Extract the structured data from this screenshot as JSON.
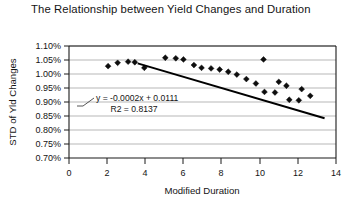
{
  "chart_data": {
    "type": "scatter",
    "title": "The Relationship between Yield Changes and Duration",
    "title_line1": "The Relationship between Yield Changes",
    "title_line2": "and Duration",
    "xlabel": "Modified Duration",
    "ylabel": "STD of Yld Changes",
    "xlim": [
      0,
      14
    ],
    "ylim": [
      0.007,
      0.011
    ],
    "xticks": [
      0,
      2,
      4,
      6,
      8,
      10,
      12,
      14
    ],
    "xtick_labels": [
      "0",
      "2",
      "4",
      "6",
      "8",
      "10",
      "12",
      "14"
    ],
    "yticks": [
      0.007,
      0.0075,
      0.008,
      0.0085,
      0.009,
      0.0095,
      0.01,
      0.0105,
      0.011
    ],
    "ytick_labels": [
      "0.70%",
      "0.75%",
      "0.80%",
      "0.85%",
      "0.90%",
      "0.95%",
      "1.00%",
      "1.05%",
      "1.10%"
    ],
    "grid": "horizontal",
    "legend": "none",
    "marker": "diamond",
    "series": [
      {
        "name": "STD of Yld Changes vs Modified Duration",
        "points": [
          {
            "x": 2.05,
            "y": 0.01028
          },
          {
            "x": 2.55,
            "y": 0.0104
          },
          {
            "x": 3.1,
            "y": 0.01044
          },
          {
            "x": 3.45,
            "y": 0.01042
          },
          {
            "x": 3.95,
            "y": 0.01022
          },
          {
            "x": 5.05,
            "y": 0.01058
          },
          {
            "x": 5.6,
            "y": 0.01056
          },
          {
            "x": 6.0,
            "y": 0.01052
          },
          {
            "x": 6.55,
            "y": 0.01032
          },
          {
            "x": 6.95,
            "y": 0.01022
          },
          {
            "x": 7.45,
            "y": 0.0102
          },
          {
            "x": 7.9,
            "y": 0.01016
          },
          {
            "x": 8.35,
            "y": 0.01008
          },
          {
            "x": 8.8,
            "y": 0.00998
          },
          {
            "x": 9.3,
            "y": 0.00982
          },
          {
            "x": 10.2,
            "y": 0.01052
          },
          {
            "x": 10.25,
            "y": 0.00936
          },
          {
            "x": 10.8,
            "y": 0.00934
          },
          {
            "x": 11.0,
            "y": 0.00972
          },
          {
            "x": 11.4,
            "y": 0.00958
          },
          {
            "x": 11.55,
            "y": 0.00908
          },
          {
            "x": 12.05,
            "y": 0.00906
          },
          {
            "x": 12.2,
            "y": 0.00946
          },
          {
            "x": 12.65,
            "y": 0.00922
          },
          {
            "x": 9.8,
            "y": 0.00966
          }
        ]
      }
    ],
    "trendline": {
      "equation_text": "y = -0.0002x + 0.0111",
      "r2_text": "R2 = 0.8137",
      "slope": -0.0002,
      "intercept": 0.0111,
      "r_squared": 0.8137,
      "x_start": 3.6,
      "x_end": 13.4
    }
  }
}
